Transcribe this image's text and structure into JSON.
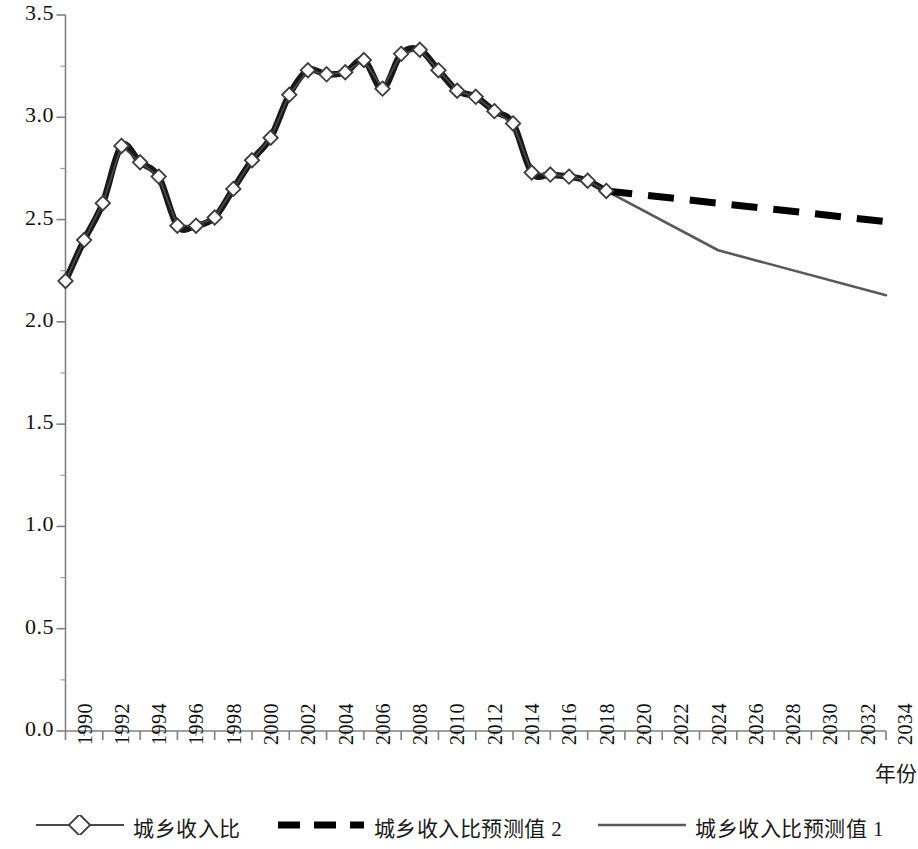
{
  "chart_data": {
    "type": "line",
    "title": "",
    "xlabel": "年份",
    "ylabel": "",
    "xlim": [
      1990,
      2034
    ],
    "ylim": [
      0.0,
      3.5
    ],
    "grid": false,
    "legend_position": "bottom",
    "y_ticks": [
      "0.0",
      "0.5",
      "1.0",
      "1.5",
      "2.0",
      "2.5",
      "3.0",
      "3.5"
    ],
    "y_tick_values": [
      0.0,
      0.5,
      1.0,
      1.5,
      2.0,
      2.5,
      3.0,
      3.5
    ],
    "x_ticks": [
      "1990",
      "1992",
      "1994",
      "1996",
      "1998",
      "2000",
      "2002",
      "2004",
      "2006",
      "2008",
      "2010",
      "2012",
      "2014",
      "2016",
      "2018",
      "2020",
      "2022",
      "2024",
      "2026",
      "2028",
      "2030",
      "2032",
      "2034"
    ],
    "x_tick_values": [
      1990,
      1992,
      1994,
      1996,
      1998,
      2000,
      2002,
      2004,
      2006,
      2008,
      2010,
      2012,
      2014,
      2016,
      2018,
      2020,
      2022,
      2024,
      2026,
      2028,
      2030,
      2032,
      2034
    ],
    "series": [
      {
        "name": "城乡收入比",
        "style": "solid-thin-with-diamond-markers",
        "color": "#4a4a4a",
        "marker": "diamond-open",
        "x": [
          1990,
          1991,
          1992,
          1993,
          1994,
          1995,
          1996,
          1997,
          1998,
          1999,
          2000,
          2001,
          2002,
          2003,
          2004,
          2005,
          2006,
          2007,
          2008,
          2009,
          2010,
          2011,
          2012,
          2013,
          2014,
          2015,
          2016,
          2017,
          2018,
          2019
        ],
        "values": [
          2.2,
          2.4,
          2.58,
          2.86,
          2.78,
          2.71,
          2.47,
          2.47,
          2.51,
          2.65,
          2.79,
          2.9,
          3.11,
          3.23,
          3.21,
          3.22,
          3.28,
          3.14,
          3.31,
          3.33,
          3.23,
          3.13,
          3.1,
          3.03,
          2.97,
          2.73,
          2.72,
          2.71,
          2.69,
          2.64
        ]
      },
      {
        "name": "城乡收入比预测值 2",
        "style": "dashed-thick",
        "color": "#000000",
        "x": [
          2019,
          2034
        ],
        "values": [
          2.64,
          2.49
        ],
        "note": "thick dashed forecast, gently declining"
      },
      {
        "name": "城乡收入比预测值 1",
        "style": "solid-thin",
        "color": "#595959",
        "x": [
          2019,
          2025,
          2034
        ],
        "values": [
          2.64,
          2.35,
          2.13
        ],
        "note": "thin solid forecast with kink at 2025, steeper decline"
      }
    ]
  },
  "axis": {
    "y_title": "",
    "x_title": "年份"
  },
  "legend": {
    "items": [
      {
        "label": "城乡收入比",
        "icon": "line-with-diamond-marker-icon"
      },
      {
        "label": "城乡收入比预测值 2",
        "icon": "thick-dashed-line-icon"
      },
      {
        "label": "城乡收入比预测值 1",
        "icon": "thin-solid-line-icon"
      }
    ]
  }
}
